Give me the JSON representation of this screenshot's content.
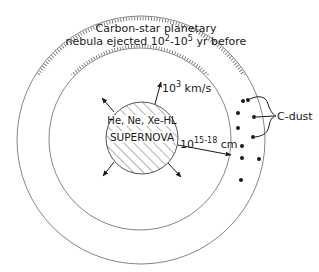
{
  "diagram": {
    "type": "schematic",
    "colors": {
      "line": "#555555",
      "ink": "#1a1a1a",
      "background": "#ffffff"
    },
    "nebula_label": {
      "line1": "Carbon-star planetary",
      "line2_prefix": "nebula ejected 10",
      "line2_exp1": "2",
      "line2_mid": "-10",
      "line2_exp2": "5",
      "line2_suffix": " yr before"
    },
    "supernova": {
      "label_top": "He, Ne, Xe-HL",
      "label_main": "SUPERNOVA"
    },
    "velocity_label": {
      "base": "10",
      "exp": "3",
      "unit": " km/s"
    },
    "distance_label": {
      "base": "10",
      "exp": "15-18",
      "unit": " cm"
    },
    "dust_label": "C-dust",
    "shapes": {
      "outer_circle": {
        "cx": 141,
        "cy": 140,
        "r": 124
      },
      "inner_circle": {
        "cx": 140,
        "cy": 139,
        "r": 91
      },
      "supernova_circle": {
        "cx": 142,
        "cy": 138,
        "r": 36
      }
    }
  }
}
